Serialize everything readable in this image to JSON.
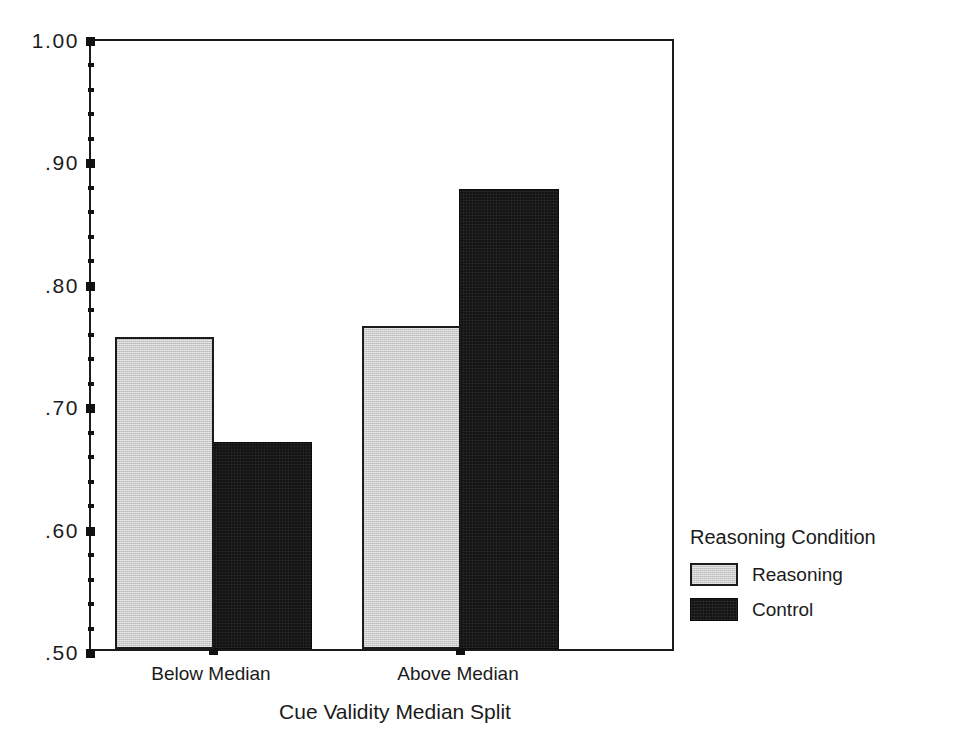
{
  "chart_data": {
    "type": "bar",
    "title": "",
    "xlabel": "Cue Validity Median Split",
    "ylabel": "",
    "categories": [
      "Below Median",
      "Above Median"
    ],
    "series": [
      {
        "name": "Reasoning",
        "values": [
          0.755,
          0.764
        ],
        "color": "#c9c9c9"
      },
      {
        "name": "Control",
        "values": [
          0.669,
          0.876
        ],
        "color": "#131313"
      }
    ],
    "ylim": [
      0.5,
      1.0
    ],
    "ytick_labels": [
      "1.00",
      ".90",
      ".80",
      ".70",
      ".60",
      ".50"
    ],
    "ytick_values": [
      1.0,
      0.9,
      0.8,
      0.7,
      0.6,
      0.5
    ],
    "yminor_step": 0.02,
    "grid": false,
    "legend": {
      "title": "Reasoning Condition",
      "position": "right",
      "entries": [
        {
          "label": "Reasoning",
          "swatch": "light"
        },
        {
          "label": "Control",
          "swatch": "dark"
        }
      ]
    }
  },
  "figure": {
    "background": "#ffffff",
    "frame_color": "#1b1b1b"
  }
}
